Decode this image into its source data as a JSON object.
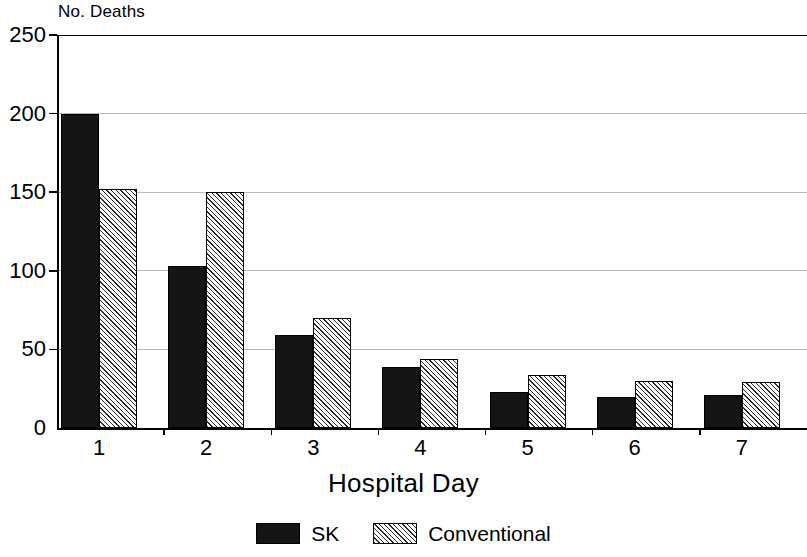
{
  "chart_data": {
    "type": "bar",
    "title": "",
    "ylabel": "No. Deaths",
    "xlabel": "Hospital Day",
    "categories": [
      "1",
      "2",
      "3",
      "4",
      "5",
      "6",
      "7"
    ],
    "series": [
      {
        "name": "SK",
        "values": [
          200,
          103,
          59,
          39,
          23,
          20,
          21
        ],
        "fill": "solid-black",
        "color": "#151515"
      },
      {
        "name": "Conventional",
        "values": [
          152,
          150,
          70,
          44,
          34,
          30,
          29
        ],
        "fill": "diagonal-hatch",
        "color": "#2a2a2a"
      }
    ],
    "ylim": [
      0,
      250
    ],
    "yticks": [
      0,
      50,
      100,
      150,
      200,
      250
    ],
    "ytick_labels": [
      "0",
      "50",
      "100",
      "150",
      "200",
      "250"
    ],
    "grid": true,
    "grid_axis": "y",
    "legend_position": "bottom-center",
    "legend": [
      {
        "label": "SK",
        "swatch": "solid-black"
      },
      {
        "label": "Conventional",
        "swatch": "diagonal-hatch"
      }
    ]
  }
}
